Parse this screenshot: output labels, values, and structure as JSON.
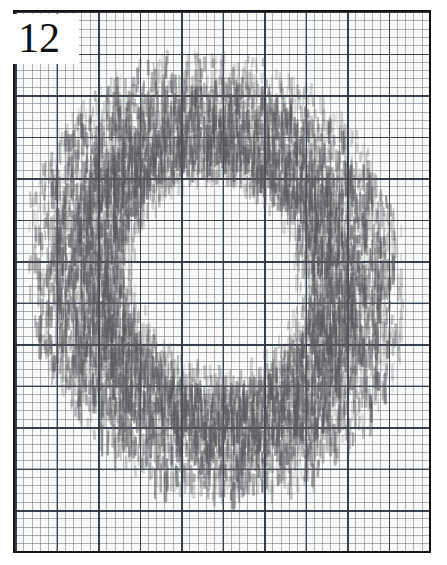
{
  "document": {
    "kind": "scanned-graph-paper-sheet",
    "width_px": 447,
    "height_px": 565,
    "background_color": "#ffffff",
    "paper_color": "#fbfbf9"
  },
  "frame": {
    "name": "plate-border",
    "color": "#131313",
    "left_px": 13,
    "top_px": 10,
    "width_px": 418,
    "height_px": 543,
    "border_width_px": 2.5
  },
  "plate_label": {
    "text": "12",
    "color": "#101010",
    "font_size_px": 42,
    "background_color": "#fdfdfb"
  },
  "grid": {
    "minor_spacing_px": 8.3,
    "minor_color": "#687486",
    "major_spacing_px": 41.5,
    "major_every_n_minor": 5,
    "major_color": "#2c3442",
    "columns_minor": 50,
    "rows_minor": 65
  },
  "drawing": {
    "name": "hatched-annulus",
    "description": "hand-drawn ring / annulus rendered with dense short vertical graphite hatch strokes, slightly tilted, hollow white centre",
    "medium": "graphite pencil",
    "stroke_color": "#5a5a5e",
    "stroke_orientation": "vertical",
    "shape": "annulus",
    "outer_center_x": 214,
    "outer_center_y": 268,
    "outer_radius_x": 188,
    "outer_radius_y": 222,
    "inner_radius_x": 78,
    "inner_radius_y": 92,
    "rotation_deg": -14,
    "bbox": {
      "x": 28,
      "y": 38,
      "width": 374,
      "height": 455
    },
    "hatch_stroke_count": 1500,
    "hatch_column_spacing_px": 3.0,
    "hatch_min_length_px": 6,
    "hatch_max_length_px": 26,
    "opacity_min": 0.1,
    "opacity_max": 0.62
  },
  "chart_data": {
    "type": "scatter",
    "title": "12",
    "xlabel": "",
    "ylabel": "",
    "grid": true,
    "legend": null,
    "radial_profile": {
      "normalized_radius": [
        0.0,
        0.15,
        0.3,
        0.4,
        0.5,
        0.6,
        0.7,
        0.8,
        0.9,
        1.0
      ],
      "density": [
        0.0,
        0.0,
        0.05,
        0.35,
        0.78,
        0.95,
        0.9,
        0.7,
        0.38,
        0.08
      ]
    }
  }
}
